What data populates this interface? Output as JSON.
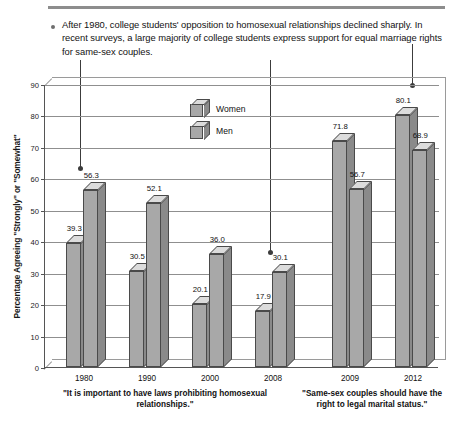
{
  "note": {
    "bullet_icon": "bullet-dot-icon",
    "text": "After 1980, college students' opposition to homosexual relationships declined sharply. In recent surveys, a large majority of college students express support for equal marriage rights for same-sex couples."
  },
  "legend": {
    "items": [
      {
        "label": "Women",
        "icon": "cube-icon"
      },
      {
        "label": "Men",
        "icon": "cube-icon"
      }
    ]
  },
  "axis": {
    "y_title": "Percentage Agreeing \"Strongly\" or \"Somewhat\"",
    "y_ticks": [
      "0",
      "10",
      "20",
      "30",
      "40",
      "50",
      "60",
      "70",
      "80",
      "90"
    ]
  },
  "captions": {
    "left": "\"It is important to have laws prohibiting homosexual relationships.\"",
    "right": "\"Same-sex couples should have the right to legal marital status.\""
  },
  "chart_data": {
    "type": "bar",
    "title": "",
    "xlabel": "",
    "ylabel": "Percentage Agreeing \"Strongly\" or \"Somewhat\"",
    "ylim": [
      0,
      90
    ],
    "ytick_step": 10,
    "grid": true,
    "legend_position": "inside-upper-left",
    "style": "3d-clustered-column",
    "categories": [
      "1980",
      "1990",
      "2000",
      "2008",
      "2009",
      "2012"
    ],
    "series": [
      {
        "name": "Women",
        "values": [
          39.3,
          30.5,
          20.1,
          17.9,
          71.8,
          80.1
        ]
      },
      {
        "name": "Men",
        "values": [
          56.3,
          52.1,
          36.0,
          30.1,
          56.7,
          68.9
        ]
      }
    ],
    "group_captions": [
      {
        "applies_to": [
          "1980",
          "1990",
          "2000",
          "2008"
        ],
        "text": "\"It is important to have laws prohibiting homosexual relationships.\""
      },
      {
        "applies_to": [
          "2009",
          "2012"
        ],
        "text": "\"Same-sex couples should have the right to legal marital status.\""
      }
    ],
    "annotations": [
      {
        "type": "leader-line",
        "target": "1980 Men bar"
      },
      {
        "type": "leader-line",
        "target": "2008 Men bar"
      },
      {
        "type": "leader-line",
        "target": "2012 Women bar"
      }
    ]
  },
  "colors": {
    "bar_face": "#a8a8a8",
    "bar_side": "#8a8a8a",
    "bar_top": "#dcdcdc",
    "grid": "#8f8f8f",
    "rule": "#8d8d8d"
  }
}
